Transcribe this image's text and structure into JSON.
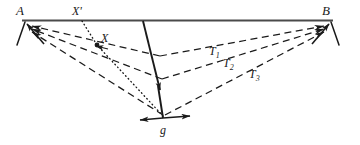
{
  "figure": {
    "background_color": "#ffffff",
    "stroke_color": "#1a1a1a",
    "top_bar_color": "#4a4a4a",
    "width": 360,
    "height": 145,
    "labels": {
      "vertex_left": "A",
      "vertex_right": "B",
      "point_projected": "X'",
      "point_mass": "X",
      "tension_1": "T",
      "tension_1_sub": "1",
      "tension_2": "T",
      "tension_2_sub": "2",
      "tension_3": "T",
      "tension_3_sub": "3",
      "gravity": "g"
    },
    "geometry": {
      "support_bar": {
        "x1": 22,
        "y1": 20,
        "x2": 333,
        "y2": 20
      },
      "vertex_left": {
        "x": 25,
        "y": 22
      },
      "vertex_right": {
        "x": 331,
        "y": 22
      },
      "vertex_bottom": {
        "x": 163,
        "y": 118
      },
      "point_mass": {
        "x": 97,
        "y": 45
      },
      "point_projected": {
        "x": 82,
        "y": 21
      },
      "tension_lines": [
        {
          "name": "T1",
          "from": [
            25,
            22
          ],
          "to": [
            331,
            22
          ],
          "sag_y": 55
        },
        {
          "name": "T2",
          "from": [
            25,
            22
          ],
          "to": [
            331,
            22
          ],
          "sag_y": 78
        },
        {
          "name": "T3",
          "from": [
            25,
            22
          ],
          "to": [
            331,
            22
          ],
          "sag_y": 112
        }
      ]
    }
  }
}
